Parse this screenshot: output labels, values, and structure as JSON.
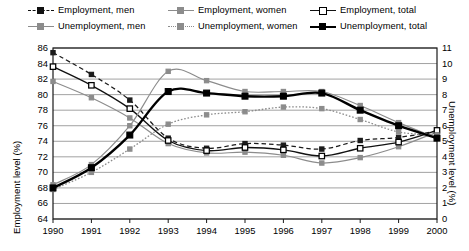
{
  "legend": {
    "items": [
      {
        "label": "Employment, men",
        "key": "dashed-dark-square",
        "row": 0,
        "col": 0
      },
      {
        "label": "Employment, women",
        "key": "solid-grey-square",
        "row": 0,
        "col": 1
      },
      {
        "label": "Employment, total",
        "key": "solid-open-square",
        "row": 0,
        "col": 2
      },
      {
        "label": "Unemployment, men",
        "key": "solid-grey-square",
        "row": 1,
        "col": 0
      },
      {
        "label": "Unemployment, women",
        "key": "dotted-grey-square",
        "row": 1,
        "col": 1
      },
      {
        "label": "Unemployment, total",
        "key": "thick-black-square",
        "row": 1,
        "col": 2
      }
    ]
  },
  "chart_data": {
    "type": "line",
    "title": "",
    "xlabel": "",
    "ylabel": "Employment level (%)",
    "y2label": "Unemployment level (%)",
    "categories": [
      "1990",
      "1991",
      "1992",
      "1993",
      "1994",
      "1995",
      "1996",
      "1997",
      "1998",
      "1999",
      "2000"
    ],
    "xticks": [
      "1990",
      "1991",
      "1992",
      "1993",
      "1994",
      "1995",
      "1996",
      "1997",
      "1998",
      "1999",
      "2000"
    ],
    "yticks_left": [
      "64",
      "66",
      "68",
      "70",
      "72",
      "74",
      "76",
      "78",
      "80",
      "82",
      "84",
      "86"
    ],
    "yticks_right": [
      "0",
      "1",
      "2",
      "3",
      "4",
      "5",
      "6",
      "7",
      "8",
      "9",
      "10",
      "11"
    ],
    "ylim": [
      64,
      86
    ],
    "y2lim": [
      0,
      11
    ],
    "grid": true,
    "legend_position": "top",
    "series": [
      {
        "name": "Employment, men",
        "axis": "left",
        "marker": "dark-square",
        "line": "dashed",
        "values": [
          85.4,
          82.6,
          79.3,
          74.4,
          73.1,
          73.7,
          73.5,
          73.0,
          74.1,
          74.5,
          75.3
        ]
      },
      {
        "name": "Employment, women",
        "axis": "left",
        "marker": "grey-square",
        "line": "solid-thin",
        "values": [
          81.7,
          79.6,
          77.0,
          73.7,
          72.5,
          72.6,
          72.2,
          71.2,
          71.9,
          73.3,
          75.2
        ]
      },
      {
        "name": "Employment, total",
        "axis": "left",
        "marker": "open-square",
        "line": "solid",
        "values": [
          83.6,
          81.2,
          78.2,
          74.1,
          72.8,
          73.2,
          72.9,
          72.1,
          73.1,
          73.9,
          75.4
        ]
      },
      {
        "name": "Unemployment, men",
        "axis": "right",
        "marker": "grey-square",
        "line": "solid-thin",
        "values": [
          2.2,
          3.5,
          6.0,
          9.5,
          8.9,
          8.2,
          8.2,
          8.2,
          7.3,
          6.2,
          5.2
        ]
      },
      {
        "name": "Unemployment, women",
        "axis": "right",
        "marker": "grey-square",
        "line": "dotted",
        "values": [
          1.9,
          3.0,
          4.5,
          6.1,
          6.7,
          6.9,
          7.2,
          7.1,
          6.4,
          5.6,
          5.4
        ]
      },
      {
        "name": "Unemployment, total",
        "axis": "right",
        "marker": "black-square",
        "line": "thick",
        "values": [
          2.0,
          3.3,
          5.4,
          8.2,
          8.1,
          7.9,
          7.9,
          8.1,
          7.0,
          6.0,
          5.2
        ]
      }
    ]
  }
}
